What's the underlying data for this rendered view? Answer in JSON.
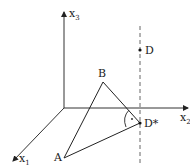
{
  "diagram": {
    "type": "3d-coordinate-geometry",
    "axes": {
      "x1": {
        "label": "x",
        "subscript": "1"
      },
      "x2": {
        "label": "x",
        "subscript": "2"
      },
      "x3": {
        "label": "x",
        "subscript": "3"
      }
    },
    "points": {
      "A": {
        "label": "A"
      },
      "B": {
        "label": "B"
      },
      "D": {
        "label": "D"
      },
      "D_star": {
        "label": "D*"
      }
    },
    "right_angle_marker": "·",
    "colors": {
      "lines": "#222222",
      "axes": "#333333",
      "dashed": "#555555"
    }
  }
}
